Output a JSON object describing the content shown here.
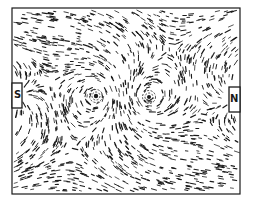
{
  "figure": {
    "frame": {
      "x": 12,
      "y": 8,
      "width": 228,
      "height": 186
    },
    "ink_color": "#1a1a1a",
    "background": "#ffffff",
    "poles": [
      {
        "label": "S",
        "x": 12,
        "y": 83,
        "width": 10,
        "height": 25
      },
      {
        "label": "N",
        "x": 229,
        "y": 87,
        "width": 11,
        "height": 25
      }
    ],
    "vortices": [
      {
        "x": 96,
        "y": 96,
        "sense": 1
      },
      {
        "x": 149,
        "y": 97,
        "sense": -1
      }
    ]
  },
  "labels": {
    "south": "S",
    "north": "N"
  }
}
